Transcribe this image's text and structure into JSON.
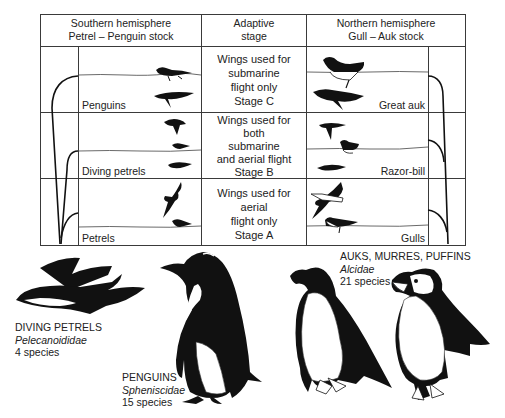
{
  "table": {
    "headers": {
      "left": [
        "Southern hemisphere",
        "Petrel – Penguin stock"
      ],
      "middle": [
        "Adaptive",
        "stage"
      ],
      "right": [
        "Northern hemisphere",
        "Gull – Auk stock"
      ]
    },
    "rows": [
      {
        "stage": [
          "Wings used for",
          "submarine",
          "flight only",
          "Stage C"
        ],
        "left_label": "Penguins",
        "right_label": "Great auk"
      },
      {
        "stage": [
          "Wings used for",
          "both",
          "submarine",
          "and aerial flight",
          "Stage B"
        ],
        "left_label": "Diving petrels",
        "right_label": "Razor-bill"
      },
      {
        "stage": [
          "Wings used for",
          "aerial",
          "flight only",
          "Stage A"
        ],
        "left_label": "Petrels",
        "right_label": "Gulls"
      }
    ]
  },
  "captions": {
    "diving_petrels": {
      "common": "DIVING PETRELS",
      "family": "Pelecanoididae",
      "count": "4 species"
    },
    "penguins": {
      "common": "PENGUINS",
      "family": "Spheniscidae",
      "count": "15 species"
    },
    "alcids": {
      "common": "AUKS, MURRES, PUFFINS",
      "family": "Alcidae",
      "count": "21 species"
    }
  },
  "icons": {
    "tree_left": "phylogeny-branches-left",
    "tree_right": "phylogeny-branches-right",
    "silhouettes": [
      "swimming-penguin",
      "diving-penguin",
      "flying-diving-petrel",
      "swimming-diving-petrel",
      "diving-diving-petrel",
      "flying-petrel",
      "swimming-petrel",
      "swimming-great-auk",
      "diving-great-auk",
      "flying-razorbill",
      "swimming-razorbill",
      "diving-razorbill",
      "flying-gull",
      "swimming-gull"
    ]
  },
  "colors": {
    "ink": "#111111",
    "line": "#3a3a3a",
    "paper": "#ffffff"
  }
}
